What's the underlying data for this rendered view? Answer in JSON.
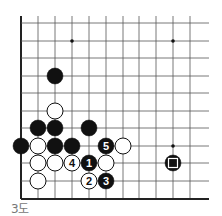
{
  "diagram": {
    "caption": "3도",
    "grid": {
      "columns_x": [
        21,
        38,
        55,
        72,
        89,
        106,
        123,
        139,
        156,
        173,
        190
      ],
      "rows_y": [
        23,
        41,
        58,
        76,
        93,
        111,
        128,
        146,
        163,
        181,
        199
      ],
      "right_extent_x": 209,
      "top_extent_y": 16,
      "bottom_edge_row": 10,
      "left_edge_col": 0,
      "line_color": "#555555",
      "edge_color": "#222222",
      "stone_radius": 8
    },
    "star_points": [
      {
        "col": 3,
        "row": 1
      },
      {
        "col": 9,
        "row": 1
      },
      {
        "col": 9,
        "row": 7
      }
    ],
    "stones": [
      {
        "color": "black",
        "col": 2,
        "row": 3
      },
      {
        "color": "white",
        "col": 2,
        "row": 5
      },
      {
        "color": "black",
        "col": 1,
        "row": 6
      },
      {
        "color": "black",
        "col": 2,
        "row": 6
      },
      {
        "color": "black",
        "col": 4,
        "row": 6
      },
      {
        "color": "black",
        "col": 0,
        "row": 7
      },
      {
        "color": "white",
        "col": 1,
        "row": 7
      },
      {
        "color": "black",
        "col": 2,
        "row": 7
      },
      {
        "color": "black",
        "col": 3,
        "row": 7
      },
      {
        "color": "black",
        "col": 5,
        "row": 7,
        "label": "5"
      },
      {
        "color": "white",
        "col": 6,
        "row": 7
      },
      {
        "color": "white",
        "col": 1,
        "row": 8
      },
      {
        "color": "white",
        "col": 2,
        "row": 8
      },
      {
        "color": "white",
        "col": 3,
        "row": 8,
        "label": "4"
      },
      {
        "color": "black",
        "col": 4,
        "row": 8,
        "label": "1"
      },
      {
        "color": "white",
        "col": 5,
        "row": 8
      },
      {
        "color": "black",
        "col": 9,
        "row": 8,
        "marker": "square"
      },
      {
        "color": "white",
        "col": 1,
        "row": 9
      },
      {
        "color": "white",
        "col": 4,
        "row": 9,
        "label": "2"
      },
      {
        "color": "black",
        "col": 5,
        "row": 9,
        "label": "3"
      }
    ]
  }
}
